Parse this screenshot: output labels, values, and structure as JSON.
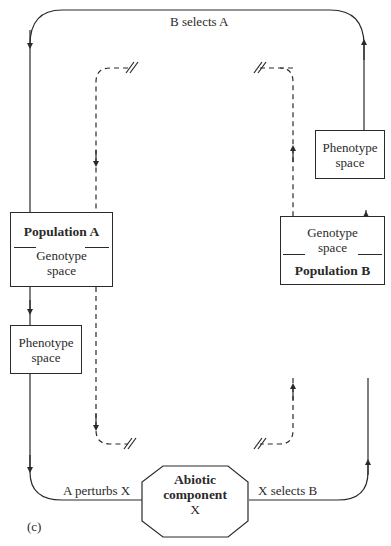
{
  "figure_label": "(c)",
  "edges": {
    "top": "B selects A",
    "bottom_left": "A perturbs X",
    "bottom_right": "X selects B"
  },
  "nodes": {
    "population_a": {
      "title": "Population A",
      "subtitle_line1": "Genotype",
      "subtitle_line2": "space"
    },
    "phenotype_a": {
      "line1": "Phenotype",
      "line2": "space"
    },
    "population_b": {
      "title": "Population B",
      "subtitle_line1": "Genotype",
      "subtitle_line2": "space"
    },
    "phenotype_b": {
      "line1": "Phenotype",
      "line2": "space"
    },
    "abiotic": {
      "line1": "Abiotic",
      "line2": "component",
      "line3": "X"
    }
  },
  "colors": {
    "stroke": "#2a2a2a",
    "background": "#ffffff"
  }
}
